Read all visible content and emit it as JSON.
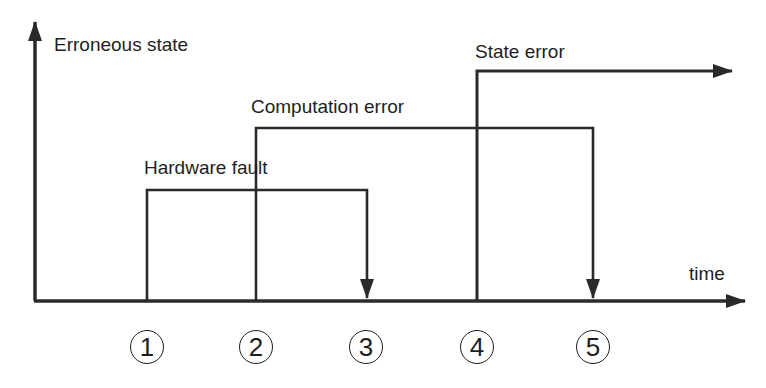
{
  "diagram": {
    "y_axis_label": "Erroneous state",
    "x_axis_label": "time",
    "signals": [
      {
        "name": "Hardware fault",
        "start_marker": 1,
        "end_marker": 3,
        "ends_with": "down-arrow"
      },
      {
        "name": "Computation error",
        "start_marker": 2,
        "end_marker": 5,
        "ends_with": "down-arrow"
      },
      {
        "name": "State error",
        "start_marker": 4,
        "end_marker": null,
        "ends_with": "right-arrow (continues)"
      }
    ],
    "markers": [
      "①",
      "②",
      "③",
      "④",
      "⑤"
    ],
    "line_color": "#2a2a2a"
  }
}
